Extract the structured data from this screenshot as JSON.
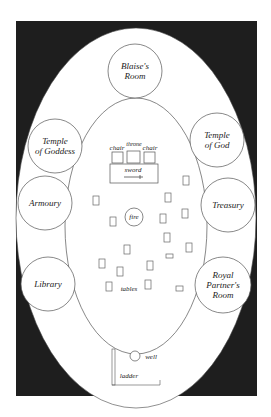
{
  "diagram": {
    "type": "floor-plan",
    "colors": {
      "background": "#ffffff",
      "frame": "#1e1e1e",
      "line": "#555555",
      "text": "#222222"
    },
    "rooms": [
      {
        "id": "blaises-room",
        "label": "Blaise's Room",
        "lines": [
          "Blaise's",
          "Room"
        ]
      },
      {
        "id": "temple-of-goddess",
        "label": "Temple of Goddess",
        "lines": [
          "Temple",
          "of Goddess"
        ]
      },
      {
        "id": "temple-of-god",
        "label": "Temple of God",
        "lines": [
          "Temple",
          "of God"
        ]
      },
      {
        "id": "armoury",
        "label": "Armoury",
        "lines": [
          "Armoury"
        ]
      },
      {
        "id": "treasury",
        "label": "Treasury",
        "lines": [
          "Treasury"
        ]
      },
      {
        "id": "library",
        "label": "Library",
        "lines": [
          "Library"
        ]
      },
      {
        "id": "royal-partners-room",
        "label": "Royal Partner's Room",
        "lines": [
          "Royal",
          "Partner's",
          "Room"
        ]
      }
    ],
    "hall": {
      "chair_left": "chair",
      "throne": "throne",
      "chair_right": "chair",
      "sword": "sword",
      "fire": "fire",
      "tables": "tables"
    },
    "entrance": {
      "well": "well",
      "ladder": "ladder"
    }
  }
}
